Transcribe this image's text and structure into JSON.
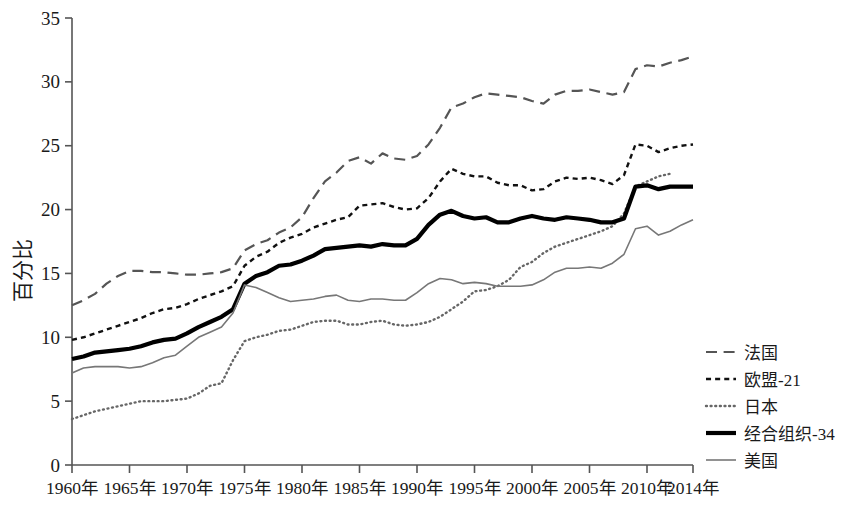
{
  "chart_data": {
    "type": "line",
    "title": "",
    "xlabel": "",
    "ylabel": "百分比",
    "xlim": [
      1960,
      2014
    ],
    "ylim": [
      0,
      35
    ],
    "grid": false,
    "legend_position": "right",
    "x_tick_labels": [
      "1960年",
      "1965年",
      "1970年",
      "1975年",
      "1980年",
      "1985年",
      "1990年",
      "1995年",
      "2000年",
      "2005年",
      "2010年",
      "2014年"
    ],
    "x_ticks": [
      1960,
      1965,
      1970,
      1975,
      1980,
      1985,
      1990,
      1995,
      2000,
      2005,
      2010,
      2014
    ],
    "y_tick_labels": [
      "0",
      "5",
      "10",
      "15",
      "20",
      "25",
      "30",
      "35"
    ],
    "y_ticks": [
      0,
      5,
      10,
      15,
      20,
      25,
      30,
      35
    ],
    "x": [
      1960,
      1961,
      1962,
      1963,
      1964,
      1965,
      1966,
      1967,
      1968,
      1969,
      1970,
      1971,
      1972,
      1973,
      1974,
      1975,
      1976,
      1977,
      1978,
      1979,
      1980,
      1981,
      1982,
      1983,
      1984,
      1985,
      1986,
      1987,
      1988,
      1989,
      1990,
      1991,
      1992,
      1993,
      1994,
      1995,
      1996,
      1997,
      1998,
      1999,
      2000,
      2001,
      2002,
      2003,
      2004,
      2005,
      2006,
      2007,
      2008,
      2009,
      2010,
      2011,
      2012,
      2013,
      2014
    ],
    "series": [
      {
        "name": "法国",
        "key": "france",
        "style": "long-dash",
        "color": "#555555",
        "width": 2.2,
        "values": [
          12.5,
          12.9,
          13.4,
          14.2,
          14.8,
          15.2,
          15.2,
          15.1,
          15.1,
          15.0,
          14.9,
          14.9,
          15.0,
          15.1,
          15.4,
          16.8,
          17.3,
          17.6,
          18.2,
          18.6,
          19.4,
          20.9,
          22.2,
          22.9,
          23.8,
          24.1,
          23.6,
          24.4,
          24.0,
          23.9,
          24.2,
          25.1,
          26.4,
          28.0,
          28.3,
          28.8,
          29.1,
          29.0,
          28.9,
          28.8,
          28.5,
          28.3,
          29.0,
          29.3,
          29.3,
          29.4,
          29.2,
          29.0,
          29.2,
          31.0,
          31.3,
          31.2,
          31.5,
          31.7,
          32.0
        ]
      },
      {
        "name": "欧盟-21",
        "key": "eu21",
        "style": "short-dash",
        "color": "#111111",
        "width": 2.4,
        "values": [
          9.8,
          10.0,
          10.3,
          10.6,
          10.9,
          11.2,
          11.5,
          11.9,
          12.2,
          12.3,
          12.6,
          13.0,
          13.3,
          13.6,
          14.0,
          15.6,
          16.3,
          16.7,
          17.4,
          17.8,
          18.1,
          18.6,
          18.9,
          19.2,
          19.4,
          20.3,
          20.4,
          20.5,
          20.2,
          20.0,
          20.1,
          20.9,
          22.2,
          23.2,
          22.8,
          22.6,
          22.6,
          22.1,
          21.9,
          21.9,
          21.5,
          21.6,
          22.2,
          22.5,
          22.4,
          22.5,
          22.3,
          22.0,
          22.7,
          25.1,
          25.0,
          24.5,
          24.8,
          25.0,
          25.1
        ]
      },
      {
        "name": "日本",
        "key": "japan",
        "style": "dotted",
        "color": "#666666",
        "width": 2.4,
        "values": [
          3.6,
          3.9,
          4.2,
          4.4,
          4.6,
          4.8,
          5.0,
          5.0,
          5.0,
          5.1,
          5.2,
          5.6,
          6.2,
          6.4,
          8.2,
          9.7,
          10.0,
          10.2,
          10.5,
          10.6,
          10.9,
          11.2,
          11.3,
          11.3,
          11.0,
          11.0,
          11.2,
          11.3,
          11.0,
          10.9,
          11.0,
          11.2,
          11.6,
          12.2,
          12.8,
          13.6,
          13.7,
          14.0,
          14.5,
          15.5,
          15.9,
          16.6,
          17.1,
          17.4,
          17.7,
          18.0,
          18.3,
          18.7,
          19.7,
          21.8,
          22.2,
          22.6,
          22.8,
          null,
          null
        ]
      },
      {
        "name": "经合组织-34",
        "key": "oecd34",
        "style": "thick-solid",
        "color": "#000000",
        "width": 4.2,
        "values": [
          8.3,
          8.5,
          8.8,
          8.9,
          9.0,
          9.1,
          9.3,
          9.6,
          9.8,
          9.9,
          10.3,
          10.8,
          11.2,
          11.6,
          12.2,
          14.2,
          14.8,
          15.1,
          15.6,
          15.7,
          16.0,
          16.4,
          16.9,
          17.0,
          17.1,
          17.2,
          17.1,
          17.3,
          17.2,
          17.2,
          17.7,
          18.8,
          19.6,
          19.9,
          19.5,
          19.3,
          19.4,
          19.0,
          19.0,
          19.3,
          19.5,
          19.3,
          19.2,
          19.4,
          19.3,
          19.2,
          19.0,
          19.0,
          19.3,
          21.8,
          21.9,
          21.6,
          21.8,
          21.8,
          21.8
        ]
      },
      {
        "name": "美国",
        "key": "usa",
        "style": "thin-solid",
        "color": "#777777",
        "width": 1.6,
        "values": [
          7.2,
          7.6,
          7.7,
          7.7,
          7.7,
          7.6,
          7.7,
          8.0,
          8.4,
          8.6,
          9.3,
          10.0,
          10.4,
          10.8,
          11.9,
          14.1,
          13.9,
          13.5,
          13.1,
          12.8,
          12.9,
          13.0,
          13.2,
          13.3,
          12.9,
          12.8,
          13.0,
          13.0,
          12.9,
          12.9,
          13.5,
          14.2,
          14.6,
          14.5,
          14.2,
          14.3,
          14.2,
          14.0,
          14.0,
          14.0,
          14.1,
          14.5,
          15.1,
          15.4,
          15.4,
          15.5,
          15.4,
          15.8,
          16.5,
          18.5,
          18.7,
          18.0,
          18.3,
          18.8,
          19.2
        ]
      }
    ]
  },
  "legend": {
    "items": [
      {
        "label": "法国",
        "key": "france"
      },
      {
        "label": "欧盟-21",
        "key": "eu21"
      },
      {
        "label": "日本",
        "key": "japan"
      },
      {
        "label": "经合组织-34",
        "key": "oecd34"
      },
      {
        "label": "美国",
        "key": "usa"
      }
    ]
  }
}
